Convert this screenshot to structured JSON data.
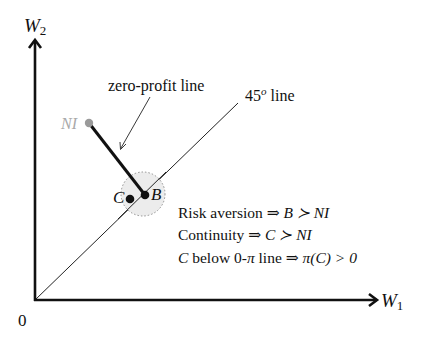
{
  "diagram": {
    "axes": {
      "y_label_main": "W",
      "y_label_sub": "2",
      "x_label_main": "W",
      "x_label_sub": "1",
      "origin_label": "0"
    },
    "annotations": {
      "zero_profit_line": "zero-profit line",
      "forty_five_line_num": "45",
      "forty_five_line_sup": "o",
      "forty_five_line_word": " line"
    },
    "points": {
      "NI": "NI",
      "B": "B",
      "C": "C"
    },
    "statements": [
      {
        "lhs": "Risk aversion",
        "arrow": "⇒",
        "rhs": "B ≻ NI"
      },
      {
        "lhs": "Continuity",
        "arrow": "⇒",
        "rhs": "C ≻ NI"
      },
      {
        "lhs_italic": "C",
        "lhs": " below 0-",
        "lhs_pi": "π",
        "lhs_end": " line",
        "arrow": "⇒",
        "rhs": "π(C) > 0"
      }
    ],
    "colors": {
      "axis": "#111111",
      "ni_point": "#9a9a9a",
      "neighborhood_fill": "#ececec",
      "neighborhood_border": "#999999"
    }
  }
}
